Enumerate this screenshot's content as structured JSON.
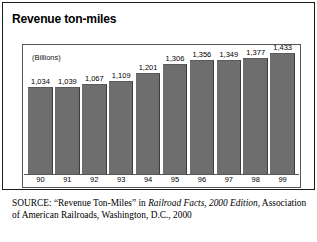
{
  "chart_data": {
    "type": "bar",
    "title": "Revenue ton-miles",
    "units_label": "(Billions)",
    "xlabel": "",
    "ylabel": "",
    "categories": [
      "90",
      "91",
      "92",
      "93",
      "94",
      "95",
      "96",
      "97",
      "98",
      "99"
    ],
    "values": [
      1034,
      1039,
      1067,
      1109,
      1201,
      1306,
      1356,
      1349,
      1377,
      1433
    ],
    "value_labels": [
      "1,034",
      "1,039",
      "1,067",
      "1,109",
      "1,201",
      "1,306",
      "1,356",
      "1,349",
      "1,377",
      "1,433"
    ],
    "ylim": [
      0,
      1520
    ],
    "grid": false,
    "legend": "none",
    "bar_color": "#6e6e6e",
    "frame_color": "#555555"
  },
  "source": {
    "prefix": "SOURCE:",
    "part1": " “Revenue Ton-Miles” in ",
    "italic_part": "Railroad Facts, 2000 Edition",
    "part2": ", Association of American Railroads, Washington, D.C., 2000"
  }
}
